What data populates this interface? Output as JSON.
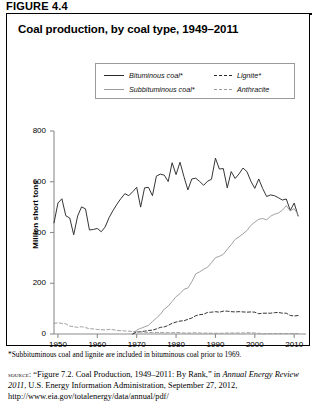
{
  "figure": {
    "label": "FIGURE 4.4",
    "title": "Coal production, by coal type, 1949–2011"
  },
  "legend": {
    "items": [
      {
        "label": "Bituminous coal*",
        "style": "solid",
        "color": "#2a2a2a"
      },
      {
        "label": "Subbituminous coal*",
        "style": "solid",
        "color": "#9b9b9b"
      },
      {
        "label": "Lignite*",
        "style": "dashed",
        "color": "#2a2a2a"
      },
      {
        "label": "Anthracite",
        "style": "dashed",
        "color": "#9b9b9b"
      }
    ]
  },
  "footnote": "*Subbituminous coal and lignite are included in bituminous coal prior to 1969.",
  "source": {
    "caps": "source:",
    "part1": " “Figure 7.2. Coal Production, 1949–2011: By Rank,” in ",
    "italic1": "Annual Energy Review 2011",
    "part2": ", U.S. Energy Information Administration, September 27, 2012, http://www.eia.gov/totalenergy/data/annual/pdf/"
  },
  "chart_data": {
    "type": "line",
    "title": "Coal production, by coal type, 1949–2011",
    "xlabel": "",
    "ylabel": "Million short tons",
    "xlim": [
      1949,
      2013
    ],
    "ylim": [
      0,
      800
    ],
    "xticks": [
      1950,
      1960,
      1970,
      1980,
      1990,
      2000,
      2010
    ],
    "yticks": [
      0,
      200,
      400,
      600,
      800
    ],
    "grid": false,
    "legend_position": "top-center",
    "x": [
      1949,
      1950,
      1951,
      1952,
      1953,
      1954,
      1955,
      1956,
      1957,
      1958,
      1959,
      1960,
      1961,
      1962,
      1963,
      1964,
      1965,
      1966,
      1967,
      1968,
      1969,
      1970,
      1971,
      1972,
      1973,
      1974,
      1975,
      1976,
      1977,
      1978,
      1979,
      1980,
      1981,
      1982,
      1983,
      1984,
      1985,
      1986,
      1987,
      1988,
      1989,
      1990,
      1991,
      1992,
      1993,
      1994,
      1995,
      1996,
      1997,
      1998,
      1999,
      2000,
      2001,
      2002,
      2003,
      2004,
      2005,
      2006,
      2007,
      2008,
      2009,
      2010,
      2011
    ],
    "series": [
      {
        "name": "Bituminous coal*",
        "color": "#2a2a2a",
        "style": "solid",
        "values": [
          438,
          516,
          533,
          466,
          457,
          391,
          465,
          501,
          493,
          410,
          412,
          416,
          403,
          422,
          459,
          487,
          512,
          534,
          553,
          545,
          561,
          578,
          500,
          576,
          578,
          545,
          622,
          630,
          626,
          601,
          675,
          628,
          677,
          620,
          568,
          611,
          614,
          601,
          586,
          602,
          610,
          693,
          650,
          652,
          576,
          640,
          613,
          631,
          654,
          640,
          602,
          574,
          611,
          573,
          542,
          548,
          545,
          537,
          528,
          532,
          487,
          516,
          465
        ]
      },
      {
        "name": "Subbituminous coal*",
        "color": "#9b9b9b",
        "style": "solid",
        "values": [
          0,
          0,
          0,
          0,
          0,
          0,
          0,
          0,
          0,
          0,
          0,
          0,
          0,
          0,
          0,
          0,
          0,
          0,
          0,
          0,
          0,
          16,
          22,
          28,
          34,
          49,
          63,
          77,
          98,
          110,
          128,
          147,
          159,
          176,
          181,
          206,
          237,
          245,
          255,
          263,
          281,
          301,
          306,
          314,
          334,
          352,
          373,
          383,
          395,
          408,
          428,
          441,
          452,
          455,
          450,
          464,
          472,
          477,
          488,
          506,
          485,
          494,
          470
        ]
      },
      {
        "name": "Lignite*",
        "color": "#2a2a2a",
        "style": "dashed",
        "values": [
          0,
          0,
          0,
          0,
          0,
          0,
          0,
          0,
          0,
          0,
          0,
          0,
          0,
          0,
          0,
          0,
          0,
          0,
          0,
          0,
          0,
          8,
          9,
          11,
          14,
          15,
          20,
          26,
          28,
          34,
          42,
          47,
          51,
          52,
          58,
          63,
          72,
          76,
          78,
          85,
          86,
          88,
          86,
          90,
          90,
          88,
          87,
          88,
          87,
          86,
          87,
          86,
          80,
          82,
          82,
          82,
          84,
          85,
          82,
          82,
          73,
          71,
          73
        ]
      },
      {
        "name": "Anthracite",
        "color": "#9b9b9b",
        "style": "dashed",
        "values": [
          42,
          44,
          42,
          40,
          31,
          29,
          26,
          29,
          25,
          21,
          20,
          18,
          17,
          16,
          18,
          17,
          14,
          13,
          12,
          11,
          10,
          9,
          8,
          7,
          6,
          6,
          6,
          6,
          5,
          5,
          5,
          6,
          5,
          4,
          4,
          4,
          5,
          4,
          3,
          4,
          3,
          3,
          3,
          3,
          4,
          4,
          4,
          4,
          4,
          5,
          5,
          4,
          3,
          1,
          1,
          2,
          2,
          2,
          2,
          2,
          2,
          2,
          2
        ]
      }
    ]
  }
}
